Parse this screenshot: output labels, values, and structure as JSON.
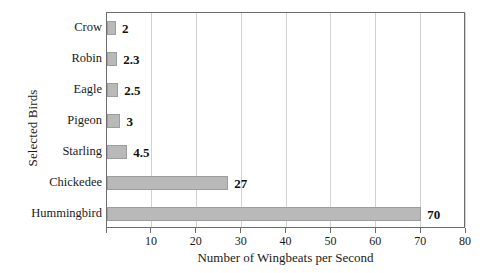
{
  "chart_data": {
    "type": "bar",
    "orientation": "horizontal",
    "title": "",
    "xlabel": "Number of Wingbeats per Second",
    "ylabel": "Selected Birds",
    "categories": [
      "Crow",
      "Robin",
      "Eagle",
      "Pigeon",
      "Starling",
      "Chickedee",
      "Hummingbird"
    ],
    "values": [
      2,
      2.3,
      2.5,
      3,
      4.5,
      27,
      70
    ],
    "value_labels": [
      "2",
      "2.3",
      "2.5",
      "3",
      "4.5",
      "27",
      "70"
    ],
    "xlim": [
      0,
      80
    ],
    "ylim": null,
    "xticks": [
      0,
      10,
      20,
      30,
      40,
      50,
      60,
      70,
      80
    ],
    "xtick_labels": [
      "",
      "10",
      "20",
      "30",
      "40",
      "50",
      "60",
      "70",
      "80"
    ],
    "grid": "vertical",
    "legend": null,
    "bar_color": "#b9b9b9",
    "bar_border_color": "#9d9d9d",
    "axis_color": "#6d6d6d",
    "gridline_color": "#d2d2d2",
    "background": "#ffffff"
  }
}
